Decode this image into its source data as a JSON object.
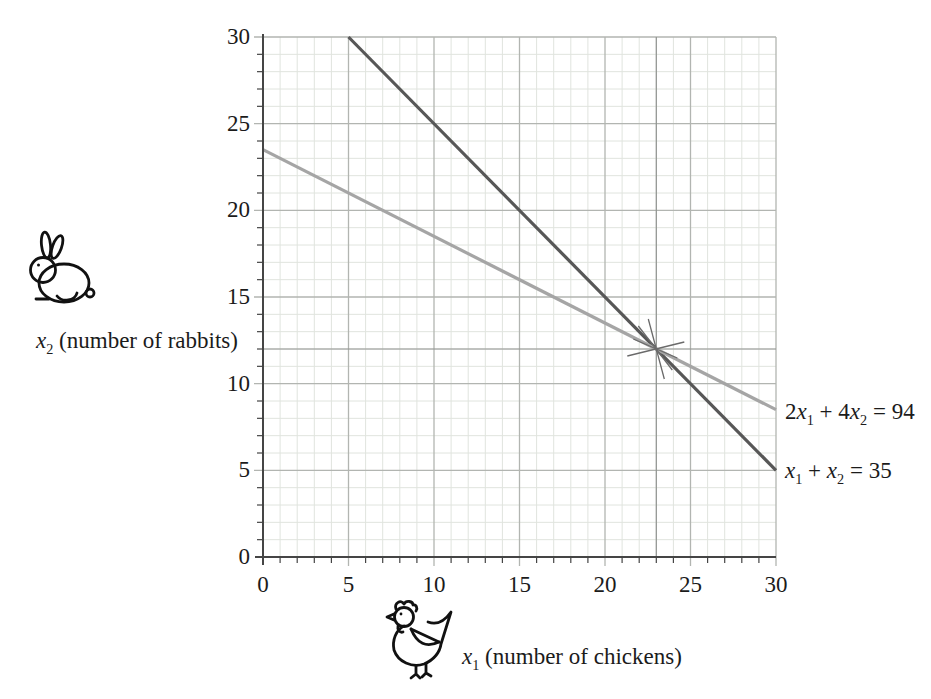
{
  "figure": {
    "background": "#ffffff",
    "description_title": "Chickens and rabbits system of equations graph"
  },
  "colors": {
    "line_dark": "#575757",
    "line_light": "#a5a5a5",
    "grid_minor": "#e0e4de",
    "grid_major": "#b2b5b1",
    "axis": "#454545",
    "guide": "#8f928f",
    "star": "#6a6a6a",
    "text": "#1b1b1b",
    "icon_stroke": "#111111"
  },
  "chart_data": {
    "type": "line",
    "title": "",
    "xlabel": "x1 (number of chickens)",
    "ylabel": "x2 (number of rabbits)",
    "xlim": [
      0,
      30
    ],
    "ylim": [
      0,
      30
    ],
    "x_ticks": [
      0,
      5,
      10,
      15,
      20,
      25,
      30
    ],
    "y_ticks": [
      0,
      5,
      10,
      15,
      20,
      25,
      30
    ],
    "minor_grid_step": 1,
    "major_grid_step": 5,
    "grid": "graph-paper: minor lines every 1 unit, major lines every 5 units",
    "legend_position": "labels at right ends of lines",
    "series": [
      {
        "name": "x1 + x2 = 35",
        "points": [
          [
            5,
            30
          ],
          [
            30,
            5
          ]
        ],
        "color_key": "line_dark"
      },
      {
        "name": "2x1 + 4x2 = 94",
        "points": [
          [
            0,
            23.5
          ],
          [
            30,
            8.5
          ]
        ],
        "color_key": "line_light"
      }
    ],
    "intersection": {
      "x": 23,
      "y": 12,
      "marker": "hand-drawn star burst"
    },
    "guides": {
      "vertical_x": 23,
      "horizontal_y": 12
    }
  },
  "labels": {
    "y_axis": [
      {
        "t": "x",
        "i": 1
      },
      {
        "t": "2",
        "sub": 1
      },
      {
        "t": " (number of rabbits)"
      }
    ],
    "x_axis": [
      {
        "t": "x",
        "i": 1
      },
      {
        "t": "1",
        "sub": 1
      },
      {
        "t": " (number of chickens)"
      }
    ],
    "eq_line_light": [
      {
        "t": "2"
      },
      {
        "t": "x",
        "i": 1
      },
      {
        "t": "1",
        "sub": 1
      },
      {
        "t": " + 4"
      },
      {
        "t": "x",
        "i": 1
      },
      {
        "t": "2",
        "sub": 1
      },
      {
        "t": " = 94"
      }
    ],
    "eq_line_dark": [
      {
        "t": "x",
        "i": 1
      },
      {
        "t": "1",
        "sub": 1
      },
      {
        "t": " + "
      },
      {
        "t": "x",
        "i": 1
      },
      {
        "t": "2",
        "sub": 1
      },
      {
        "t": " = 35"
      }
    ]
  },
  "icons": {
    "y_axis_icon": "rabbit-icon",
    "x_axis_icon": "chicken-icon"
  }
}
